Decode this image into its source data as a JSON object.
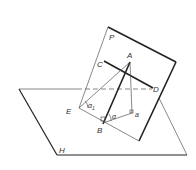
{
  "diagram": {
    "type": "geometry-planes",
    "labels": {
      "plane_p": "P",
      "plane_h": "H",
      "point_a": "A",
      "point_c": "C",
      "point_d": "D",
      "point_e": "E",
      "point_b": "B",
      "point_a_proj": "a",
      "angle_alpha1": "α",
      "angle_alpha1_sub": "1",
      "angle_alpha": "α"
    },
    "colors": {
      "line": "#222222",
      "thin_line": "#555555",
      "background": "#ffffff"
    }
  }
}
